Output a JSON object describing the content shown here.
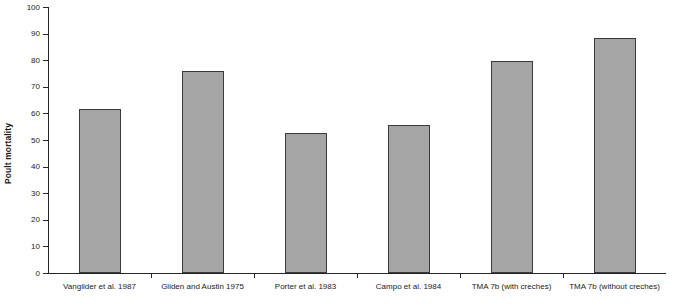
{
  "chart_data": {
    "type": "bar",
    "title": "",
    "subtitle": "",
    "xlabel": "",
    "ylabel": "Poult mortality",
    "ylim": [
      0,
      100
    ],
    "ytick_step": 10,
    "yticks": [
      0,
      10,
      20,
      30,
      40,
      50,
      60,
      70,
      80,
      90,
      100
    ],
    "grid": false,
    "legend": null,
    "categories": [
      "Vangilder et al. 1987",
      "Gliden and Austin 1975",
      "Porter et al. 1983",
      "Campo et al. 1984",
      "TMA 7b (with creches)",
      "TMA 7b (without creches)"
    ],
    "values": [
      61.7,
      75.8,
      52.8,
      55.5,
      79.7,
      88.2
    ],
    "series": [
      {
        "name": "Poult mortality",
        "values": [
          61.7,
          75.8,
          52.8,
          55.5,
          79.7,
          88.2
        ]
      }
    ],
    "bar_fill_color": "#a5a5a5",
    "bar_edge_color": "#3a3a3a",
    "axis_color": "#262626"
  }
}
